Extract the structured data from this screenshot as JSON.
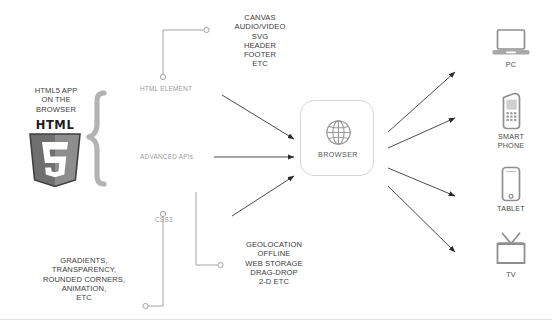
{
  "diagram": {
    "left": {
      "heading": "HTML5 APP\nON THE\nBROWSER",
      "logo_wordmark": "HTML",
      "logo_number": "5"
    },
    "branches": [
      {
        "key": "html_element",
        "label": "HTML ELEMENT"
      },
      {
        "key": "advanced_apis",
        "label": "ADVANCED APIs"
      },
      {
        "key": "css3",
        "label": "CSS3"
      }
    ],
    "callouts": [
      {
        "key": "html_element_features",
        "text": "CANVAS\nAUDIO/VIDEO\nSVG\nHEADER\nFOOTER\nETC"
      },
      {
        "key": "api_features",
        "text": "GEOLOCATION\nOFFLINE\nWEB STORAGE\nDRAG-DROP\n2-D ETC"
      },
      {
        "key": "css3_features",
        "text": "GRADIENTS,\nTRANSPARENCY,\nROUNDED CORNERS,\nANIMATION,\nETC"
      }
    ],
    "center": {
      "label": "BROWSER",
      "icon": "globe-icon"
    },
    "devices": [
      {
        "key": "pc",
        "label": "PC",
        "icon": "laptop-icon"
      },
      {
        "key": "phone",
        "label": "SMART\nPHONE",
        "icon": "smartphone-icon"
      },
      {
        "key": "tablet",
        "label": "TABLET",
        "icon": "tablet-icon"
      },
      {
        "key": "tv",
        "label": "TV",
        "icon": "tv-icon"
      }
    ],
    "colors": {
      "line": "#8c8c8c",
      "arrow": "#2b2b2b",
      "brace": "#b3b3b3",
      "box_border": "#d6d6d6",
      "icon_gray": "#8f8f8f",
      "logo_dark": "#3f3f3f",
      "logo_light": "#9d9d9d",
      "text_dark": "#3b3b3b",
      "text_mid": "#9a9a9a",
      "background": "#ffffff"
    }
  }
}
